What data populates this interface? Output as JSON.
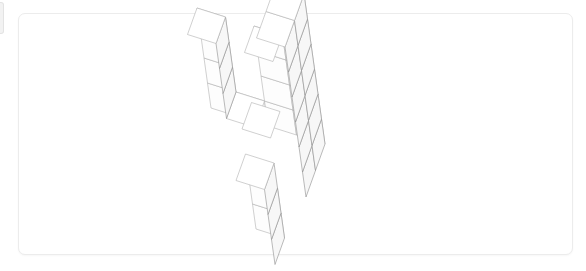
{
  "canvas": {
    "width": 586,
    "height": 271,
    "background": "#ffffff"
  },
  "edge_sliver": {
    "name": "clipped-card-edge",
    "color": "#f2f2f2",
    "border": "#e3e3e3"
  },
  "card": {
    "name": "figure-card",
    "x": 18,
    "y": 13,
    "width": 555,
    "height": 242,
    "background": "#ffffff",
    "border_color": "#ececec",
    "corner_radius": 7
  },
  "figure": {
    "title": "",
    "type": "isometric-voxel-structure",
    "stroke_color": "#b0b0b0",
    "stroke_color_dark": "#8d8d8d",
    "top_face_fill": "#ffffff",
    "left_face_fill": "#fdfdfd",
    "right_face_fill": "#f7f7f7",
    "stroke_width": 0.6,
    "origin": {
      "x": 268,
      "y": 126
    },
    "axes": {
      "note": "screen offsets in px for one unit step along each voxel axis",
      "ax": {
        "dx": 28.5,
        "dy": 9.0
      },
      "ay": {
        "dx": -9.5,
        "dy": 26.5
      },
      "az": {
        "dx": -3.5,
        "dy": -25.0
      }
    },
    "voxels": [
      [
        0,
        0,
        0
      ],
      [
        1,
        0,
        0
      ],
      [
        0,
        1,
        0
      ],
      [
        1,
        1,
        0
      ],
      [
        0,
        0,
        1
      ],
      [
        1,
        0,
        1
      ],
      [
        0,
        1,
        1
      ],
      [
        1,
        1,
        1
      ],
      [
        0,
        0,
        2
      ],
      [
        1,
        0,
        2
      ],
      [
        1,
        1,
        2
      ],
      [
        0,
        0,
        3
      ],
      [
        1,
        0,
        3
      ],
      [
        1,
        1,
        3
      ],
      [
        1,
        0,
        4
      ],
      [
        1,
        1,
        4
      ],
      [
        1,
        0,
        5
      ],
      [
        1,
        1,
        5
      ],
      [
        -1,
        0,
        0
      ],
      [
        -2,
        0,
        0
      ],
      [
        -2,
        0,
        1
      ],
      [
        -2,
        0,
        2
      ],
      [
        -2,
        0,
        3
      ],
      [
        0,
        2,
        0
      ],
      [
        0,
        2,
        -1
      ],
      [
        0,
        2,
        -2
      ]
    ],
    "voxel_count": 26
  }
}
